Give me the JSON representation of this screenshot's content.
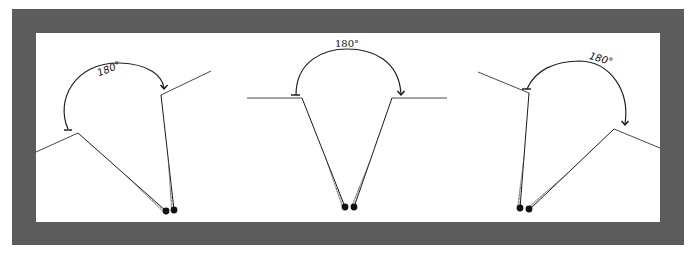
{
  "figure": {
    "frame": {
      "outer": {
        "x": 12,
        "y": 9,
        "w": 672,
        "h": 236,
        "color": "#5c5c5c"
      },
      "inner": {
        "x": 36,
        "y": 33,
        "w": 624,
        "h": 189,
        "color": "#ffffff"
      }
    },
    "panels": [
      {
        "id": "left",
        "angle_label": "180°",
        "label_pos": {
          "x": 110,
          "y": 72,
          "rotate": -22
        },
        "label_style": "sans",
        "surfaces": [
          {
            "x1": 36,
            "y1": 152,
            "x2": 78,
            "y2": 133
          },
          {
            "x1": 161,
            "y1": 95,
            "x2": 211,
            "y2": 71
          }
        ],
        "shafts": [
          {
            "x1": 78,
            "y1": 133,
            "x2": 166,
            "y2": 211
          },
          {
            "x1": 161,
            "y1": 95,
            "x2": 174,
            "y2": 210
          }
        ],
        "arc": {
          "d": "M 68 129 C 55 100, 75 62, 120 63 C 148 64, 162 75, 164 88"
        },
        "arc_start_tbar": {
          "x1": 64,
          "y1": 130,
          "x2": 72,
          "y2": 130
        },
        "arrow_end": {
          "x": 164,
          "y": 89
        },
        "probe_heads": [
          {
            "x": 166,
            "y": 211
          },
          {
            "x": 174,
            "y": 210
          }
        ]
      },
      {
        "id": "middle",
        "angle_label": "180°",
        "label_pos": {
          "x": 347,
          "y": 47,
          "rotate": 0
        },
        "label_style": "serif",
        "surfaces": [
          {
            "x1": 247,
            "y1": 98,
            "x2": 302,
            "y2": 98
          },
          {
            "x1": 392,
            "y1": 98,
            "x2": 447,
            "y2": 98
          }
        ],
        "shafts": [
          {
            "x1": 302,
            "y1": 98,
            "x2": 345,
            "y2": 207
          },
          {
            "x1": 392,
            "y1": 98,
            "x2": 354,
            "y2": 207
          }
        ],
        "arc": {
          "d": "M 296 95 C 296 60, 325 49, 347 49 C 372 49, 399 60, 401 94"
        },
        "arc_start_tbar": {
          "x1": 291,
          "y1": 95,
          "x2": 300,
          "y2": 95
        },
        "arrow_end": {
          "x": 401,
          "y": 95
        },
        "probe_heads": [
          {
            "x": 345,
            "y": 207
          },
          {
            "x": 354,
            "y": 207
          }
        ]
      },
      {
        "id": "right",
        "angle_label": "180°",
        "label_pos": {
          "x": 600,
          "y": 62,
          "rotate": 16
        },
        "label_style": "sans",
        "surfaces": [
          {
            "x1": 478,
            "y1": 72,
            "x2": 529,
            "y2": 93
          },
          {
            "x1": 614,
            "y1": 129,
            "x2": 660,
            "y2": 148
          }
        ],
        "shafts": [
          {
            "x1": 529,
            "y1": 93,
            "x2": 520,
            "y2": 208
          },
          {
            "x1": 614,
            "y1": 129,
            "x2": 530,
            "y2": 209
          }
        ],
        "arc": {
          "d": "M 527 89 C 535 70, 555 61, 580 61 C 610 62, 630 90, 625 124"
        },
        "arc_start_tbar": {
          "x1": 522,
          "y1": 89,
          "x2": 531,
          "y2": 89
        },
        "arrow_end": {
          "x": 625,
          "y": 125
        },
        "probe_heads": [
          {
            "x": 520,
            "y": 208
          },
          {
            "x": 529,
            "y": 209
          }
        ]
      }
    ]
  }
}
